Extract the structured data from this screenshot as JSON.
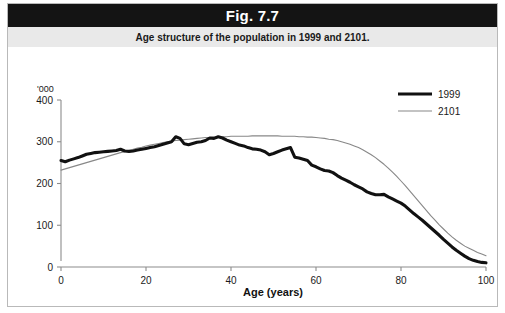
{
  "figure": {
    "title": "Fig. 7.7",
    "subtitle": "Age structure of the population in 1999 and 2101."
  },
  "colors": {
    "title_bar_bg": "#141414",
    "title_text": "#ffffff",
    "subtitle_bar_bg": "#e9e9e9",
    "series_1999": "#111111",
    "series_2101": "#888888",
    "axis": "#8c8c8c",
    "frame": "#b9b9b9"
  },
  "axes": {
    "y_unit": "'000",
    "y_ticks": [
      "0",
      "100",
      "200",
      "300",
      "400"
    ],
    "x_ticks": [
      "0",
      "20",
      "40",
      "60",
      "80",
      "100"
    ],
    "x_title": "Age (years)"
  },
  "legend": {
    "position": "top-right",
    "entries": [
      {
        "label": "1999",
        "style": "thick-black"
      },
      {
        "label": "2101",
        "style": "thin-grey"
      }
    ]
  },
  "chart_data": {
    "type": "line",
    "title": "Fig. 7.7",
    "subtitle": "Age structure of the population in 1999 and 2101.",
    "xlabel": "Age (years)",
    "ylabel": "'000",
    "xlim": [
      0,
      100
    ],
    "ylim": [
      0,
      400
    ],
    "xticks": [
      0,
      20,
      40,
      60,
      80,
      100
    ],
    "yticks": [
      0,
      100,
      200,
      300,
      400
    ],
    "grid": false,
    "legend_position": "top-right",
    "x": [
      0,
      1,
      2,
      3,
      4,
      5,
      6,
      7,
      8,
      9,
      10,
      11,
      12,
      13,
      14,
      15,
      16,
      17,
      18,
      19,
      20,
      21,
      22,
      23,
      24,
      25,
      26,
      27,
      28,
      29,
      30,
      31,
      32,
      33,
      34,
      35,
      36,
      37,
      38,
      39,
      40,
      41,
      42,
      43,
      44,
      45,
      46,
      47,
      48,
      49,
      50,
      51,
      52,
      53,
      54,
      55,
      56,
      57,
      58,
      59,
      60,
      61,
      62,
      63,
      64,
      65,
      66,
      67,
      68,
      69,
      70,
      71,
      72,
      73,
      74,
      75,
      76,
      77,
      78,
      79,
      80,
      81,
      82,
      83,
      84,
      85,
      86,
      87,
      88,
      89,
      90,
      91,
      92,
      93,
      94,
      95,
      96,
      97,
      98,
      99,
      100
    ],
    "series": [
      {
        "name": "1999",
        "values": [
          255,
          252,
          256,
          259,
          262,
          266,
          270,
          272,
          274,
          275,
          276,
          277,
          278,
          279,
          282,
          278,
          277,
          278,
          280,
          282,
          284,
          286,
          288,
          291,
          294,
          297,
          300,
          312,
          308,
          295,
          293,
          296,
          299,
          300,
          303,
          309,
          308,
          312,
          309,
          304,
          300,
          296,
          292,
          290,
          286,
          283,
          282,
          280,
          276,
          269,
          272,
          276,
          280,
          283,
          286,
          263,
          261,
          258,
          255,
          244,
          240,
          235,
          231,
          230,
          226,
          219,
          213,
          208,
          203,
          197,
          192,
          187,
          180,
          176,
          173,
          173,
          174,
          168,
          163,
          158,
          153,
          146,
          137,
          128,
          120,
          112,
          103,
          94,
          85,
          76,
          66,
          57,
          48,
          40,
          33,
          26,
          20,
          16,
          13,
          11,
          10
        ]
      },
      {
        "name": "2101",
        "values": [
          232,
          235,
          238,
          241,
          244,
          247,
          250,
          253,
          256,
          259,
          262,
          265,
          268,
          271,
          274,
          276,
          279,
          282,
          285,
          287,
          290,
          292,
          294,
          296,
          298,
          300,
          301,
          303,
          304,
          305,
          306,
          307,
          308,
          309,
          310,
          310,
          311,
          311,
          312,
          312,
          313,
          313,
          313,
          313,
          313,
          314,
          314,
          314,
          314,
          314,
          314,
          314,
          313,
          313,
          313,
          313,
          312,
          312,
          311,
          311,
          310,
          309,
          308,
          306,
          305,
          303,
          300,
          297,
          294,
          290,
          286,
          281,
          275,
          269,
          262,
          254,
          246,
          237,
          227,
          217,
          206,
          195,
          183,
          171,
          159,
          147,
          135,
          123,
          112,
          101,
          91,
          81,
          72,
          64,
          57,
          50,
          45,
          40,
          35,
          31,
          27
        ]
      }
    ]
  }
}
